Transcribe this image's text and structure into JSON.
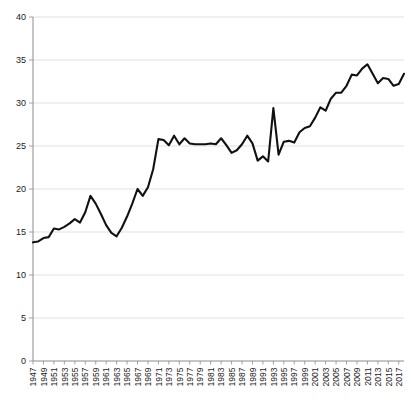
{
  "chart_data": {
    "type": "line",
    "title": "",
    "subtitle": "",
    "xlabel": "",
    "ylabel": "",
    "grid": true,
    "legend": false,
    "legend_position": "none",
    "line_color": "#111111",
    "grid_color": "#d9d9d9",
    "axis_color": "#8c8c8c",
    "xlim": [
      1947,
      2018
    ],
    "ylim": [
      0,
      40
    ],
    "ytick_labels": [
      "0",
      "5",
      "10",
      "15",
      "20",
      "25",
      "30",
      "35",
      "40"
    ],
    "yticks": [
      0,
      5,
      10,
      15,
      20,
      25,
      30,
      35,
      40
    ],
    "xtick_labels": [
      "1947",
      "1949",
      "1951",
      "1953",
      "1955",
      "1957",
      "1959",
      "1961",
      "1963",
      "1965",
      "1967",
      "1969",
      "1971",
      "1973",
      "1975",
      "1977",
      "1979",
      "1981",
      "1983",
      "1985",
      "1987",
      "1989",
      "1991",
      "1993",
      "1995",
      "1997",
      "1999",
      "2001",
      "2003",
      "2005",
      "2007",
      "2009",
      "2011",
      "2013",
      "2015",
      "2017"
    ],
    "xticks": [
      1947,
      1949,
      1951,
      1953,
      1955,
      1957,
      1959,
      1961,
      1963,
      1965,
      1967,
      1969,
      1971,
      1973,
      1975,
      1977,
      1979,
      1981,
      1983,
      1985,
      1987,
      1989,
      1991,
      1993,
      1995,
      1997,
      1999,
      2001,
      2003,
      2005,
      2007,
      2009,
      2011,
      2013,
      2015,
      2017
    ],
    "series": [
      {
        "name": "series-1",
        "x": [
          1947,
          1948,
          1949,
          1950,
          1951,
          1952,
          1953,
          1954,
          1955,
          1956,
          1957,
          1958,
          1959,
          1960,
          1961,
          1962,
          1963,
          1964,
          1965,
          1966,
          1967,
          1968,
          1969,
          1970,
          1971,
          1972,
          1973,
          1974,
          1975,
          1976,
          1977,
          1978,
          1979,
          1980,
          1981,
          1982,
          1983,
          1984,
          1985,
          1986,
          1987,
          1988,
          1989,
          1990,
          1991,
          1992,
          1993,
          1994,
          1995,
          1996,
          1997,
          1998,
          1999,
          2000,
          2001,
          2002,
          2003,
          2004,
          2005,
          2006,
          2007,
          2008,
          2009,
          2010,
          2011,
          2012,
          2013,
          2014,
          2015,
          2016,
          2017,
          2018
        ],
        "y": [
          13.8,
          13.9,
          14.3,
          14.4,
          15.4,
          15.3,
          15.6,
          16.0,
          16.5,
          16.1,
          17.3,
          19.2,
          18.3,
          17.1,
          15.8,
          14.9,
          14.5,
          15.5,
          16.8,
          18.3,
          20.0,
          19.2,
          20.2,
          22.3,
          25.8,
          25.7,
          25.1,
          26.2,
          25.2,
          25.9,
          25.3,
          25.2,
          25.2,
          25.2,
          25.3,
          25.2,
          25.9,
          25.1,
          24.2,
          24.5,
          25.2,
          26.2,
          25.3,
          23.3,
          23.8,
          23.2,
          29.4,
          24.0,
          25.5,
          25.6,
          25.4,
          26.6,
          27.1,
          27.3,
          28.3,
          29.5,
          29.1,
          30.5,
          31.2,
          31.2,
          32.0,
          33.3,
          33.2,
          34.0,
          34.5,
          33.4,
          32.3,
          32.9,
          32.8,
          32.0,
          32.2,
          33.4
        ]
      }
    ]
  },
  "axes": {
    "y_axis_name": "y-axis",
    "x_axis_name": "x-axis"
  }
}
